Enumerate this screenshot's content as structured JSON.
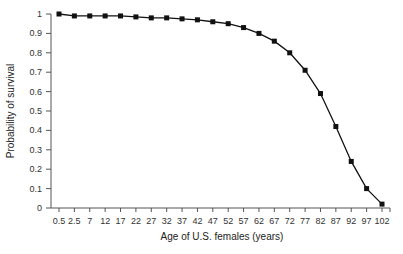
{
  "chart_data": {
    "type": "line",
    "title": "",
    "xlabel": "Age of U.S. females (years)",
    "ylabel": "Probability of survival",
    "ylim": [
      0,
      1
    ],
    "yticks": [
      "0",
      "0.1",
      "0.2",
      "0.3",
      "0.4",
      "0.5",
      "0.6",
      "0.7",
      "0.8",
      "0.9",
      "1"
    ],
    "categories": [
      "0.5",
      "2.5",
      "7",
      "12",
      "17",
      "22",
      "27",
      "32",
      "37",
      "42",
      "47",
      "52",
      "57",
      "62",
      "67",
      "72",
      "77",
      "82",
      "87",
      "92",
      "97",
      "102"
    ],
    "series": [
      {
        "name": "Survival",
        "values": [
          1.0,
          0.99,
          0.99,
          0.99,
          0.99,
          0.985,
          0.98,
          0.98,
          0.975,
          0.97,
          0.96,
          0.95,
          0.93,
          0.9,
          0.86,
          0.8,
          0.71,
          0.59,
          0.42,
          0.24,
          0.1,
          0.02
        ]
      }
    ],
    "marker": "square",
    "line_color": "#111111",
    "grid": false,
    "legend": "none"
  }
}
